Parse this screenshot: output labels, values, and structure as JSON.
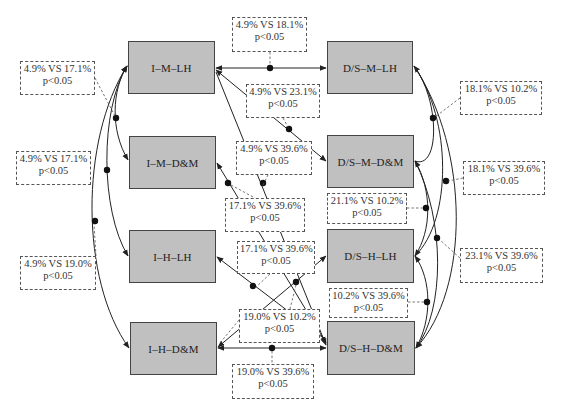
{
  "nodes": [
    {
      "id": "I-M-LH",
      "label": "I–M–LH",
      "x": 128,
      "y": 41,
      "w": 87,
      "h": 53
    },
    {
      "id": "I-M-D&M",
      "label": "I–M–D&M",
      "x": 129,
      "y": 136,
      "w": 87,
      "h": 53
    },
    {
      "id": "I-H-LH",
      "label": "I–H–LH",
      "x": 129,
      "y": 230,
      "w": 87,
      "h": 53
    },
    {
      "id": "I-H-D&M",
      "label": "I–H–D&M",
      "x": 130,
      "y": 322,
      "w": 87,
      "h": 53
    },
    {
      "id": "D/S-M-LH",
      "label": "D/S–M–LH",
      "x": 327,
      "y": 41,
      "w": 86,
      "h": 53
    },
    {
      "id": "D/S-M-D&M",
      "label": "D/S–M–D&M",
      "x": 327,
      "y": 135,
      "w": 87,
      "h": 53
    },
    {
      "id": "D/S-H-LH",
      "label": "D/S–H–LH",
      "x": 327,
      "y": 229,
      "w": 87,
      "h": 54
    },
    {
      "id": "D/S-H-D&M",
      "label": "D/S–H–D&M",
      "x": 327,
      "y": 321,
      "w": 88,
      "h": 54
    }
  ],
  "annotations": [
    {
      "id": "a1",
      "compare": "4.9% VS 18.1%",
      "p": "p<0.05",
      "x": 232,
      "y": 17,
      "w": 75,
      "h": 35
    },
    {
      "id": "a2",
      "compare": "4.9% VS 17.1%",
      "p": "p<0.05",
      "x": 20,
      "y": 61,
      "w": 75,
      "h": 34
    },
    {
      "id": "a3",
      "compare": "4.9% VS 23.1%",
      "p": "p<0.05",
      "x": 246,
      "y": 84,
      "w": 74,
      "h": 34
    },
    {
      "id": "a4",
      "compare": "18.1% VS 10.2%",
      "p": "p<0.05",
      "x": 460,
      "y": 81,
      "w": 82,
      "h": 34
    },
    {
      "id": "a5",
      "compare": "4.9% VS 17.1%",
      "p": "p<0.05",
      "x": 16,
      "y": 151,
      "w": 75,
      "h": 34
    },
    {
      "id": "a6",
      "compare": "4.9% VS 39.6%",
      "p": "p<0.05",
      "x": 236,
      "y": 141,
      "w": 76,
      "h": 34
    },
    {
      "id": "a7",
      "compare": "18.1% VS 39.6%",
      "p": "p<0.05",
      "x": 463,
      "y": 161,
      "w": 82,
      "h": 34
    },
    {
      "id": "a8",
      "compare": "17.1% VS 39.6%",
      "p": "p<0.05",
      "x": 225,
      "y": 198,
      "w": 80,
      "h": 34
    },
    {
      "id": "a9",
      "compare": "21.1% VS 10.2%",
      "p": "p<0.05",
      "x": 327,
      "y": 193,
      "w": 80,
      "h": 31
    },
    {
      "id": "a10",
      "compare": "17.1% VS 39.6%",
      "p": "p<0.05",
      "x": 237,
      "y": 241,
      "w": 78,
      "h": 33
    },
    {
      "id": "a11",
      "compare": "23.1% VS 39.6%",
      "p": "p<0.05",
      "x": 460,
      "y": 248,
      "w": 83,
      "h": 35
    },
    {
      "id": "a12",
      "compare": "4.9% VS 19.0%",
      "p": "p<0.05",
      "x": 20,
      "y": 256,
      "w": 76,
      "h": 34
    },
    {
      "id": "a13",
      "compare": "10.2% VS 39.6%",
      "p": "p<0.05",
      "x": 329,
      "y": 288,
      "w": 79,
      "h": 30
    },
    {
      "id": "a14",
      "compare": "19.0% VS 10.2%",
      "p": "p<0.05",
      "x": 239,
      "y": 309,
      "w": 81,
      "h": 34
    },
    {
      "id": "a15",
      "compare": "19.0% VS 39.6%",
      "p": "p<0.05",
      "x": 232,
      "y": 364,
      "w": 82,
      "h": 35
    }
  ],
  "colors": {
    "node_fill": "#c0c0c0",
    "node_border": "#444444",
    "line": "#222222",
    "dash": "#555555"
  }
}
